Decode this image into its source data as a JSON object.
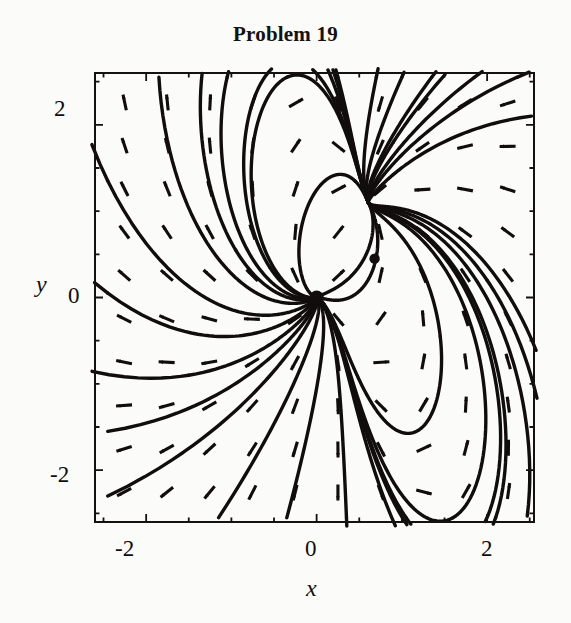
{
  "figure": {
    "title": "Problem 19",
    "type": "direction-field-phase-portrait"
  },
  "axes": {
    "x_title": "x",
    "y_title": "y",
    "x_ticks": [
      "-2",
      "0",
      "2"
    ],
    "y_ticks": [
      "2",
      "0",
      "-2"
    ],
    "x_tick_m2": "-2",
    "x_tick_0": "0",
    "x_tick_2": "2",
    "y_tick_2": "2",
    "y_tick_0": "0",
    "y_tick_m2": "-2"
  },
  "colors": {
    "ink": "#100d0c",
    "paper": "#fbfbf9",
    "frame": "#15110f"
  },
  "chart_data": {
    "type": "scatter",
    "title": "Problem 19",
    "xlabel": "x",
    "ylabel": "y",
    "xlim": [
      -2.6,
      2.55
    ],
    "ylim": [
      -2.6,
      2.6
    ],
    "grid": false,
    "legend": null,
    "xticks": [
      -2,
      0,
      2
    ],
    "yticks": [
      -2,
      0,
      2
    ],
    "xticklabels": [
      "-2",
      "0",
      "2"
    ],
    "yticklabels": [
      "-2",
      "0",
      "2"
    ],
    "minor_tick_step": 0.5,
    "equilibrium_points": [
      {
        "x": 0.0,
        "y": 0.0,
        "label": "",
        "marker": "filled-dot"
      },
      {
        "x": 0.68,
        "y": 0.45,
        "label": "",
        "marker": "filled-dot"
      },
      {
        "x": 2.5,
        "y": 1.05,
        "label": "",
        "marker": "node"
      }
    ],
    "direction_field": {
      "description": "grid of unit-length direction arrows",
      "x_start": -2.25,
      "x_step": 0.5,
      "x_count": 10,
      "y_start": -2.25,
      "y_step": 0.5,
      "y_count": 10,
      "arrow_length_px": 16
    },
    "trajectories_count": 16,
    "series": [
      {
        "name": "direction-field",
        "values": []
      },
      {
        "name": "solution-curves",
        "values": []
      }
    ]
  }
}
